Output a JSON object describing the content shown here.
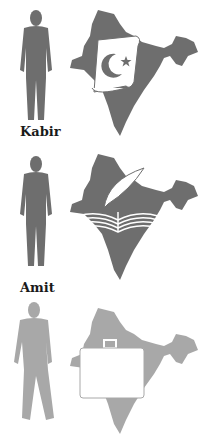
{
  "panels": [
    {
      "name": "Kabir",
      "symbol": "scroll-crescent-star",
      "color": "#6e6e6e"
    },
    {
      "name": "Amit",
      "symbol": "book-quill",
      "color": "#6e6e6e"
    },
    {
      "name": "",
      "symbol": "briefcase",
      "color": "#a8a8a8"
    }
  ]
}
